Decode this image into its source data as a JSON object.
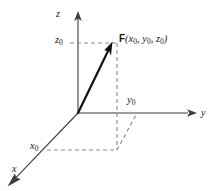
{
  "figure": {
    "type": "3d-vector-diagram",
    "background_color": "#ffffff",
    "axis_color": "#3d3d3d",
    "vector_color": "#111111",
    "dashed_color": "#8a8a8a",
    "axes": {
      "z_label": "z",
      "y_label": "y",
      "x_label": "x"
    },
    "coordinate_marks": {
      "z0": "z",
      "z0_sub": "0",
      "y0": "y",
      "y0_sub": "0",
      "x0": "x",
      "x0_sub": "0"
    },
    "point_label": {
      "vector_name": "F",
      "open_paren": "(",
      "x_var": "x",
      "x_sub": "0",
      "sep1": ", ",
      "y_var": "y",
      "y_sub": "0",
      "sep2": ", ",
      "z_var": "z",
      "z_sub": "0",
      "close_paren": ")"
    }
  }
}
